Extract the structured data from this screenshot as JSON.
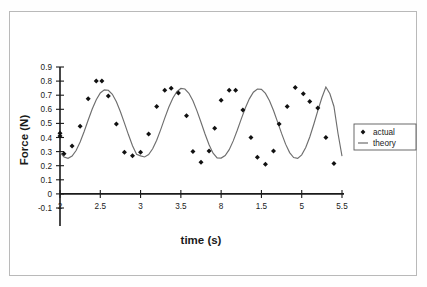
{
  "figure": {
    "border_color": "#b9b9b9",
    "background": "#ffffff"
  },
  "chart_data": {
    "type": "scatter",
    "title": "",
    "subtitle": "",
    "xlabel": "time (s)",
    "ylabel": "Force (N)",
    "xlim": [
      2.0,
      5.5
    ],
    "ylim": [
      -0.1,
      0.9
    ],
    "xticks": [
      2,
      2.5,
      3,
      3.5,
      4,
      4.5,
      5,
      5.5
    ],
    "xtick_labels": [
      "2",
      "2.5",
      "3",
      "3.5",
      "8",
      "1.5",
      "5",
      "5.5"
    ],
    "yticks": [
      -0.1,
      0,
      0.1,
      0.2,
      0.3,
      0.4,
      0.5,
      0.6,
      0.7,
      0.8,
      0.9
    ],
    "ytick_labels": [
      "-0.1",
      "0",
      "0.1",
      "0.2",
      "0.3",
      "0.4",
      "0.5",
      "0.6",
      "0.7",
      "0.8",
      "0.9"
    ],
    "grid": false,
    "legend_position": "right",
    "x_axis_crosses_y_at": 0,
    "series": [
      {
        "name": "actual",
        "type": "scatter",
        "marker": "diamond",
        "color": "#111111",
        "x": [
          2.0,
          2.0,
          2.05,
          2.15,
          2.25,
          2.35,
          2.45,
          2.52,
          2.6,
          2.7,
          2.8,
          2.9,
          3.0,
          3.1,
          3.2,
          3.3,
          3.38,
          3.47,
          3.57,
          3.65,
          3.75,
          3.85,
          3.92,
          4.0,
          4.1,
          4.18,
          4.27,
          4.37,
          4.45,
          4.55,
          4.65,
          4.72,
          4.82,
          4.92,
          5.02,
          5.1,
          5.2,
          5.3,
          5.4
        ],
        "y": [
          0.43,
          0.41,
          0.285,
          0.34,
          0.48,
          0.675,
          0.8,
          0.8,
          0.695,
          0.495,
          0.295,
          0.27,
          0.295,
          0.425,
          0.62,
          0.735,
          0.75,
          0.715,
          0.555,
          0.3,
          0.225,
          0.305,
          0.465,
          0.665,
          0.735,
          0.735,
          0.595,
          0.4,
          0.26,
          0.21,
          0.305,
          0.495,
          0.62,
          0.755,
          0.71,
          0.655,
          0.61,
          0.4,
          0.215
        ]
      },
      {
        "name": "theory",
        "type": "line",
        "color": "#6e6e6e",
        "description": "sinusoidal fit, mean 0.50, amplitude 0.24, period 0.85 s",
        "mean": 0.5,
        "amplitude": 0.24,
        "period": 0.85,
        "phase_min_at": 2.08,
        "x": [
          2.0,
          2.05,
          2.1,
          2.15,
          2.2,
          2.25,
          2.3,
          2.35,
          2.4,
          2.45,
          2.5,
          2.55,
          2.6,
          2.65,
          2.7,
          2.75,
          2.8,
          2.85,
          2.9,
          2.95,
          3.0,
          3.05,
          3.1,
          3.15,
          3.2,
          3.25,
          3.3,
          3.35,
          3.4,
          3.45,
          3.5,
          3.55,
          3.6,
          3.65,
          3.7,
          3.75,
          3.8,
          3.85,
          3.9,
          3.95,
          4.0,
          4.05,
          4.1,
          4.15,
          4.2,
          4.25,
          4.3,
          4.35,
          4.4,
          4.45,
          4.5,
          4.55,
          4.6,
          4.65,
          4.7,
          4.75,
          4.8,
          4.85,
          4.9,
          4.95,
          5.0,
          5.05,
          5.1,
          5.15,
          5.2,
          5.25,
          5.3,
          5.35,
          5.4,
          5.45,
          5.5
        ],
        "y": [
          0.295,
          0.262,
          0.252,
          0.268,
          0.308,
          0.368,
          0.443,
          0.524,
          0.602,
          0.668,
          0.716,
          0.738,
          0.735,
          0.706,
          0.653,
          0.583,
          0.502,
          0.419,
          0.342,
          0.281,
          0.27,
          0.262,
          0.279,
          0.32,
          0.381,
          0.456,
          0.537,
          0.614,
          0.679,
          0.725,
          0.748,
          0.744,
          0.714,
          0.66,
          0.589,
          0.508,
          0.425,
          0.349,
          0.289,
          0.255,
          0.254,
          0.272,
          0.314,
          0.376,
          0.451,
          0.532,
          0.609,
          0.674,
          0.721,
          0.744,
          0.741,
          0.713,
          0.661,
          0.591,
          0.511,
          0.429,
          0.353,
          0.293,
          0.258,
          0.252,
          0.277,
          0.329,
          0.404,
          0.494,
          0.59,
          0.682,
          0.758,
          0.71,
          0.62,
          0.43,
          0.268
        ]
      }
    ],
    "annotations": []
  },
  "legend": {
    "entries": [
      {
        "label": "actual",
        "marker": "diamond",
        "color": "#111111"
      },
      {
        "label": "theory",
        "marker": "line",
        "color": "#6e6e6e"
      }
    ]
  }
}
